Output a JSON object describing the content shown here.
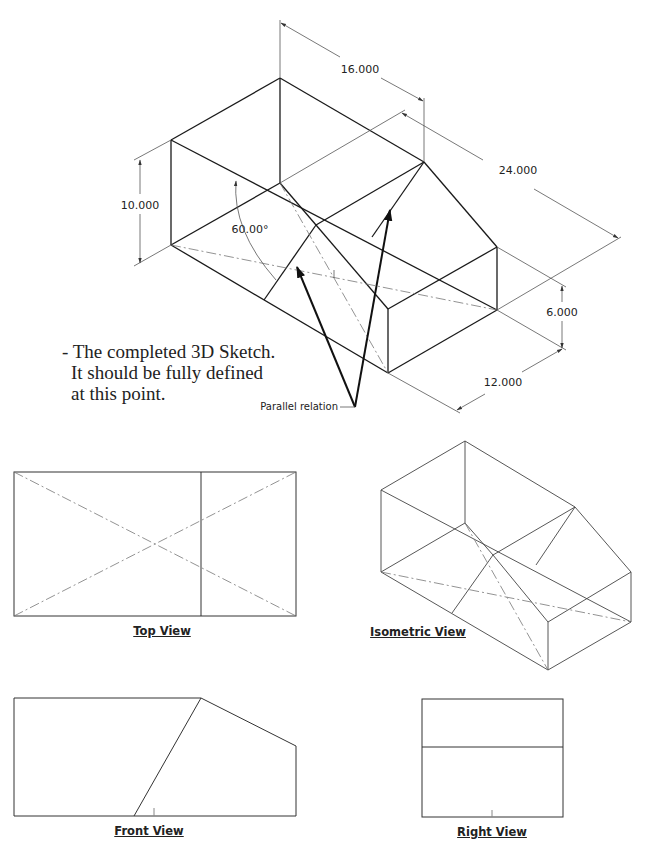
{
  "main_sketch": {
    "dimensions": {
      "width_top": "16.000",
      "depth": "24.000",
      "height_left": "10.000",
      "height_right": "6.000",
      "width_bottom": "12.000",
      "angle": "60.00°"
    },
    "callout": "Parallel relation"
  },
  "note": {
    "lines": [
      "- The completed 3D Sketch.",
      "It should be fully defined",
      "at this point."
    ]
  },
  "views": {
    "top": "Top View",
    "isometric": "Isometric View",
    "front": "Front View",
    "right": "Right View"
  }
}
